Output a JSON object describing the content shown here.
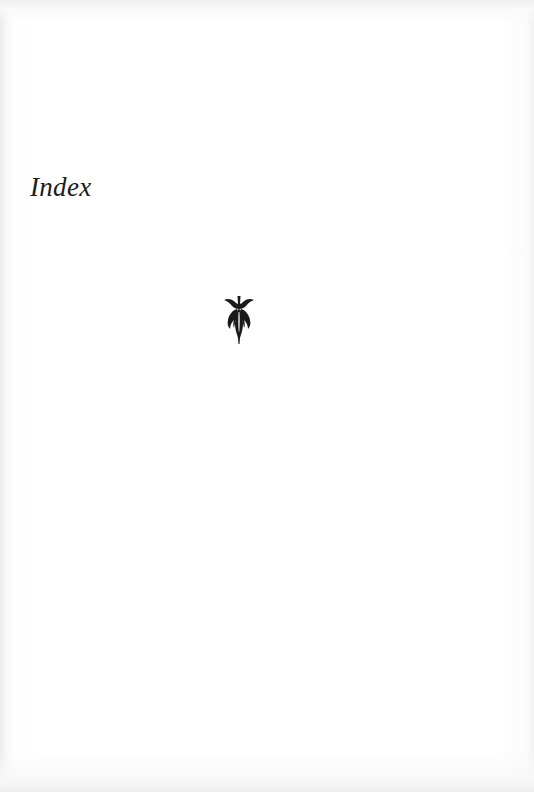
{
  "page": {
    "heading": "Index",
    "ornament": "fleuron-ornament",
    "colors": {
      "paper": "#ffffff",
      "ink": "#1c1c1c"
    }
  }
}
